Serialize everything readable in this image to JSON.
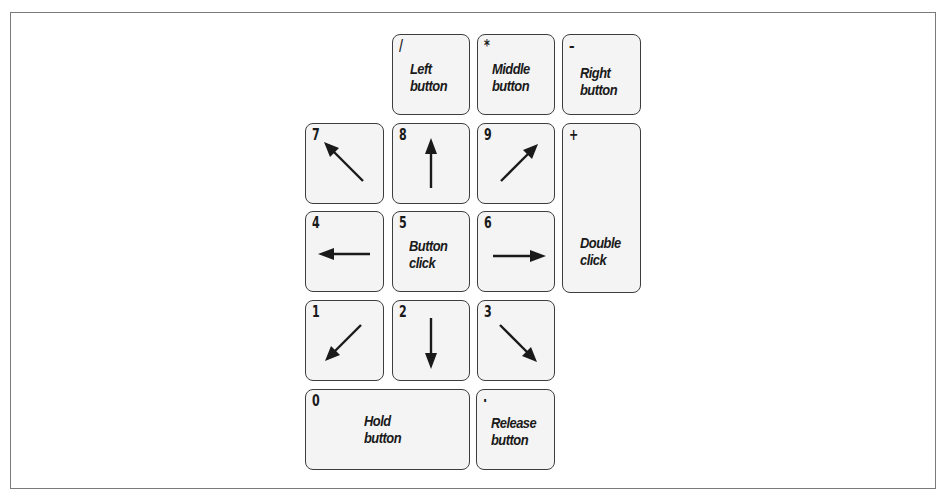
{
  "diagram": {
    "colors": {
      "key_fill": "#f4f4f4",
      "key_border": "#3d3d3d",
      "text": "#1a1a1a",
      "frame_border": "#7a7a7a"
    },
    "keys": {
      "divide": {
        "symbol": "/",
        "label": "Left\nbutton",
        "action": "left-button"
      },
      "multiply": {
        "symbol": "*",
        "label": "Middle\nbutton",
        "action": "middle-button"
      },
      "minus": {
        "symbol": "–",
        "label": "Right\nbutton",
        "action": "right-button"
      },
      "seven": {
        "symbol": "7",
        "icon": "arrow-up-left-icon"
      },
      "eight": {
        "symbol": "8",
        "icon": "arrow-up-icon"
      },
      "nine": {
        "symbol": "9",
        "icon": "arrow-up-right-icon"
      },
      "plus": {
        "symbol": "+",
        "label": "Double\nclick",
        "action": "double-click"
      },
      "four": {
        "symbol": "4",
        "icon": "arrow-left-icon"
      },
      "five": {
        "symbol": "5",
        "label": "Button\nclick",
        "action": "button-click"
      },
      "six": {
        "symbol": "6",
        "icon": "arrow-right-icon"
      },
      "one": {
        "symbol": "1",
        "icon": "arrow-down-left-icon"
      },
      "two": {
        "symbol": "2",
        "icon": "arrow-down-icon"
      },
      "three": {
        "symbol": "3",
        "icon": "arrow-down-right-icon"
      },
      "zero": {
        "symbol": "0",
        "label": "Hold\nbutton",
        "action": "hold-button"
      },
      "decimal": {
        "symbol": "·",
        "label": "Release\nbutton",
        "action": "release-button"
      }
    }
  }
}
